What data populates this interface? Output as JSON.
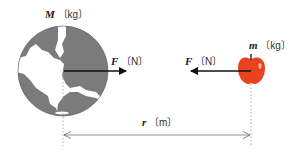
{
  "diagram": {
    "earth": {
      "mass_symbol": "M",
      "mass_unit": "〔kg〕",
      "color_ocean": "#7a7a7a",
      "color_land": "#ffffff"
    },
    "apple": {
      "mass_symbol": "m",
      "mass_unit": "〔kg〕",
      "color": "#e8431e"
    },
    "force_on_earth": {
      "symbol": "F",
      "unit": "〔N〕",
      "direction": "right"
    },
    "force_on_apple": {
      "symbol": "F",
      "unit": "〔N〕",
      "direction": "left"
    },
    "distance": {
      "symbol": "r",
      "unit": "〔m〕"
    }
  }
}
